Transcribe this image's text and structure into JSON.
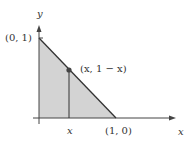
{
  "figure": {
    "colors": {
      "fill": "#d3d3d3",
      "line": "#333333",
      "axis": "#444444",
      "dot": "#444444"
    },
    "labels": {
      "y_axis": "y",
      "x_axis": "x",
      "top_vertex": "(0, 1)",
      "right_vertex": "(1, 0)",
      "point": "(x, 1 − x)",
      "x_tick": "x"
    },
    "points": {
      "origin": [
        0,
        0
      ],
      "top_vertex": [
        0,
        1
      ],
      "right_vertex": [
        1,
        0
      ],
      "sample_point": "(x, 1 − x)"
    }
  }
}
